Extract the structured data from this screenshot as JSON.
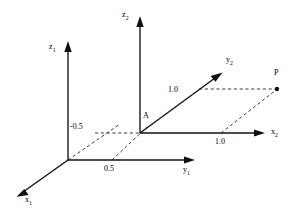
{
  "figure": {
    "type": "coordinate-frame-diagram",
    "background_color": "#ffffff",
    "line_color": "#111111",
    "dash_color": "#1a1a1a"
  },
  "frames": [
    {
      "name": "frame-1",
      "origin_label": "",
      "axes": [
        {
          "id": "z1",
          "label": "z",
          "subscript": "1",
          "direction": "up"
        },
        {
          "id": "y1",
          "label": "y",
          "subscript": "1",
          "direction": "right"
        },
        {
          "id": "x1",
          "label": "x",
          "subscript": "1",
          "direction": "down-left"
        }
      ]
    },
    {
      "name": "frame-2",
      "origin_label": "A",
      "axes": [
        {
          "id": "z2",
          "label": "z",
          "subscript": "2",
          "direction": "up"
        },
        {
          "id": "x2",
          "label": "x",
          "subscript": "2",
          "direction": "right"
        },
        {
          "id": "y2",
          "label": "y",
          "subscript": "2",
          "direction": "up-right"
        }
      ]
    }
  ],
  "labels": {
    "z1": "z",
    "z1_sub": "1",
    "y1": "y",
    "y1_sub": "1",
    "x1": "x",
    "x1_sub": "1",
    "z2": "z",
    "z2_sub": "2",
    "y2": "y",
    "y2_sub": "2",
    "x2": "x",
    "x2_sub": "2",
    "origin_A": "A",
    "point_P": "P"
  },
  "measurements": [
    {
      "id": "offset-x",
      "value": "-0.5",
      "axis": "x1"
    },
    {
      "id": "offset-y",
      "value": "0.5",
      "axis": "y1"
    },
    {
      "id": "p-y2",
      "value": "1.0",
      "axis": "y2"
    },
    {
      "id": "p-x2",
      "value": "1.0",
      "axis": "x2"
    }
  ],
  "points": [
    {
      "id": "A",
      "label": "A",
      "description": "origin of frame 2"
    },
    {
      "id": "P",
      "label": "P",
      "description": "point in frame 2"
    }
  ],
  "projections": [
    {
      "id": "origin-to-A-diagonal",
      "style": "dashed"
    },
    {
      "id": "A-offset-horizontal",
      "style": "dashed"
    },
    {
      "id": "half-offset-diagonal",
      "style": "dashed"
    },
    {
      "id": "P-horizontal",
      "style": "dashed"
    },
    {
      "id": "P-diagonal",
      "style": "dashed"
    }
  ]
}
